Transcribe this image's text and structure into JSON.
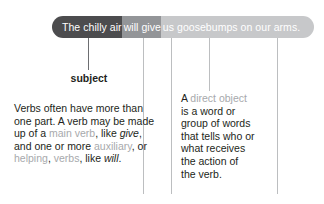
{
  "sentence": {
    "full_text": "The chilly air will give us goosebumps on our arms.",
    "segments": [
      {
        "role": "subject",
        "text": "The chilly air",
        "color": "#4c4c4e"
      },
      {
        "role": "verb",
        "text": "will give",
        "color": "#939598"
      },
      {
        "role": "direct-object",
        "text": "us goosebumps on our arms.",
        "color": "#c7c8ca"
      }
    ]
  },
  "labels": {
    "subject": "subject"
  },
  "verb_note": {
    "line1": "Verbs often have more than",
    "line2": "one part. A verb may be made",
    "line3_a": "up of a ",
    "line3_term": "main verb",
    "line3_b": ", like ",
    "line3_italic": "give",
    "line3_c": ",",
    "line4_a": "and one or more ",
    "line4_term": "auxiliary",
    "line4_b": ", or",
    "line5_term_a": "helping",
    "line5_a": ", ",
    "line5_term_b": "verbs",
    "line5_b": ", like ",
    "line5_italic": "will",
    "line5_c": "."
  },
  "object_note": {
    "line1_a": "A ",
    "line1_term": "direct object",
    "line2": "is a word or",
    "line3": "group of words",
    "line4": "that tells who or",
    "line5": "what receives",
    "line6": "the action of",
    "line7": "the verb."
  },
  "colors": {
    "term_gray": "#a7a9ac",
    "text_dark": "#231f20",
    "line_gray": "#bcbec0",
    "line_dark": "#6d6e71"
  }
}
